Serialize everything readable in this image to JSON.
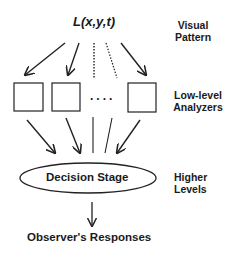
{
  "diagram": {
    "input_formula": "L(x,y,t)",
    "decision_label": "Decision Stage",
    "output_label": "Observer's Responses",
    "ellipsis": "....",
    "levels": [
      {
        "line1": "Visual",
        "line2": "Pattern"
      },
      {
        "line1": "Low-level",
        "line2": "Analyzers"
      },
      {
        "line1": "Higher",
        "line2": "Levels"
      }
    ],
    "analyzer_box_count_shown": 3,
    "stroke_color": "#222222",
    "background": "#ffffff"
  }
}
